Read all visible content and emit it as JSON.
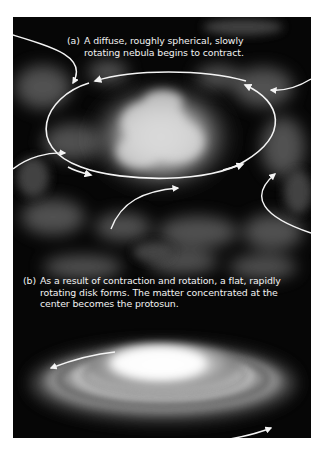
{
  "figure": {
    "panels": [
      {
        "id": "a",
        "label": "(a)",
        "caption": "A diffuse, roughly spherical, slowly rotating nebula begins to contract.",
        "caption_line1": "A diffuse, roughly spherical, slowly",
        "caption_line2": "rotating nebula begins to contract.",
        "illustration": "cloudy-nebula",
        "annotations": [
          "rotation-ellipse-arrows",
          "inflow-arrows"
        ]
      },
      {
        "id": "b",
        "label": "(b)",
        "caption": "As a result of contraction and rotation, a flat, rapidly rotating disk forms. The matter concentrated at the center becomes the protosun.",
        "caption_line1": "As a result of contraction and rotation, a flat, rapidly",
        "caption_line2": "rotating disk forms. The matter concentrated at the",
        "caption_line3": "center becomes the protosun.",
        "illustration": "protoplanetary-disk",
        "annotations": [
          "rotation-arrows"
        ]
      }
    ],
    "colors": {
      "background": "#060606",
      "arrows": "#f4f4f4",
      "text": "#f2f2f2",
      "page": "#ffffff"
    }
  }
}
